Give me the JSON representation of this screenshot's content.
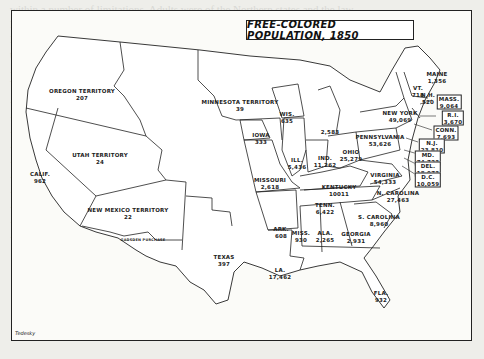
{
  "map": {
    "title": "FREE-COLORED POPULATION, 1850",
    "credit": "Tedesky",
    "regions": [
      {
        "name": "OREGON TERRITORY",
        "value": "207"
      },
      {
        "name": "UTAH TERRITORY",
        "value": "24"
      },
      {
        "name": "CALIF.",
        "value": "962"
      },
      {
        "name": "NEW MEXICO TERRITORY",
        "value": "22"
      },
      {
        "name": "GADSDEN PURCHASE",
        "value": ""
      },
      {
        "name": "TEXAS",
        "value": "397"
      },
      {
        "name": "MINNESOTA TERRITORY",
        "value": "39"
      },
      {
        "name": "IOWA",
        "value": "333"
      },
      {
        "name": "MISSOURI",
        "value": "2,618"
      },
      {
        "name": "ARK.",
        "value": "608"
      },
      {
        "name": "LA.",
        "value": "17,462"
      },
      {
        "name": "WIS.",
        "value": "635"
      },
      {
        "name": "ILL.",
        "value": "5,436"
      },
      {
        "name": "MICH.",
        "value": "2,583"
      },
      {
        "name": "IND.",
        "value": "11,262"
      },
      {
        "name": "OHIO",
        "value": "25,279"
      },
      {
        "name": "KENTUCKY",
        "value": "10011"
      },
      {
        "name": "TENN.",
        "value": "6,422"
      },
      {
        "name": "MISS.",
        "value": "930"
      },
      {
        "name": "ALA.",
        "value": "2,265"
      },
      {
        "name": "GEORGIA",
        "value": "2,931"
      },
      {
        "name": "FLA.",
        "value": "932"
      },
      {
        "name": "S. CAROLINA",
        "value": "8,960"
      },
      {
        "name": "N. CAROLINA",
        "value": "27,463"
      },
      {
        "name": "VIRGINIA",
        "value": "54,333"
      },
      {
        "name": "PENNSYLVANIA",
        "value": "53,626"
      },
      {
        "name": "NEW YORK",
        "value": "49,069"
      },
      {
        "name": "VT.",
        "value": "718"
      },
      {
        "name": "N.H.",
        "value": "520"
      },
      {
        "name": "MAINE",
        "value": "1,356"
      },
      {
        "name": "MASS.",
        "value": "9,064"
      },
      {
        "name": "R.I.",
        "value": "3,670"
      },
      {
        "name": "CONN.",
        "value": "7,693"
      },
      {
        "name": "N.J.",
        "value": "23,810"
      },
      {
        "name": "MD.",
        "value": "74,723"
      },
      {
        "name": "DEL.",
        "value": "18,073"
      },
      {
        "name": "D.C.",
        "value": "10,059"
      }
    ]
  },
  "background_text": [
    "within a number of limitations. Adults were of the Northern states and the law",
    "Negro in the great deal ... determination for white suffrage; the",
    "Massachusetts ... development of a ... consequence of a distinct and generally",
    "the colonization ... in the Promotion of the Negroes, the Negro",
    "... the ... most and many of the free-Negroes, North, were",
    "Virginia ... population ... and free Negroes",
    "... of ... and the population ... the free Negroes",
    "... during the period ... largely ... and ... ",
    "... to ... the ... of the ... Negroes ... ",
    "... the ... States ... prohibition of public",
    "... free Negroes ... a ... and ... community",
    "... on ... the ... Negroes ... ",
    "... ... institutions ... ... ",
    "... particularly in Northern economic",
    "... of the ... regarding the free Negroes",
    "... the ... of ... ..."
  ]
}
